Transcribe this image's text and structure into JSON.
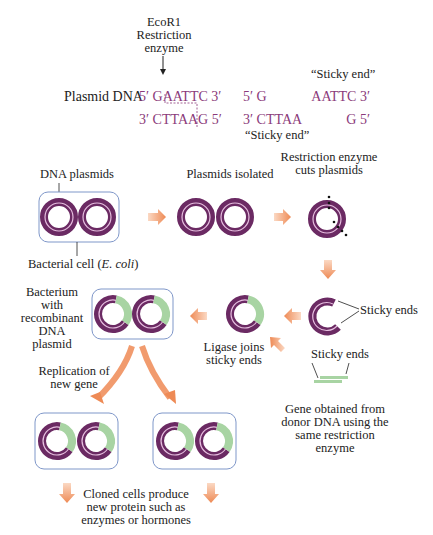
{
  "colors": {
    "plasmid": "#6b2a63",
    "plasmid_inner": "#d9a8d0",
    "gene": "#a8d4a3",
    "arrow": "#ee8a55",
    "cell_border": "#7f97c9",
    "sequence_text": "#8b3a7a",
    "label_text": "#222222"
  },
  "top": {
    "enzyme_label": [
      "EcoR1",
      "Restriction",
      "enzyme"
    ],
    "plasmid_dna_label": "Plasmid DNA",
    "uncut": {
      "top_strand": "5′ GAATTC 3′",
      "bottom_strand": "3′ CTTAAG 5′"
    },
    "cut_left": {
      "top_strand": "5′ G",
      "bottom_strand": "3′ CTTAA",
      "label": "“Sticky end”"
    },
    "cut_right": {
      "top_strand": "AATTC 3′",
      "bottom_strand": "G 5′",
      "label": "“Sticky end”"
    }
  },
  "steps": {
    "dna_plasmids": "DNA plasmids",
    "bacterial_cell": "Bacterial cell (",
    "bacterial_cell_species": "E. coli",
    "bacterial_cell_close": ")",
    "plasmids_isolated": "Plasmids isolated",
    "restriction_cuts": [
      "Restriction enzyme",
      "cuts plasmids"
    ],
    "sticky_ends_plasmid": "Sticky ends",
    "sticky_ends_gene": "Sticky ends",
    "gene_obtained": [
      "Gene obtained from",
      "donor DNA using the",
      "same restriction",
      "enzyme"
    ],
    "ligase": [
      "Ligase joins",
      "sticky ends"
    ],
    "recombinant": [
      "Bacterium",
      "with",
      "recombinant",
      "DNA",
      "plasmid"
    ],
    "replication": [
      "Replication of",
      "new gene"
    ],
    "cloned": [
      "Cloned cells produce",
      "new protein such as",
      "enzymes or hormones"
    ]
  }
}
